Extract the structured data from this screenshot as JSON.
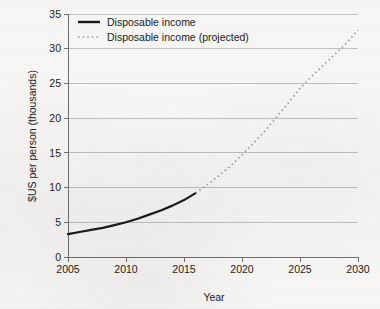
{
  "chart_data": {
    "type": "line",
    "title": "",
    "xlabel": "Year",
    "ylabel": "$US per person (thousands)",
    "xlim": [
      2005,
      2030
    ],
    "ylim": [
      0,
      35
    ],
    "grid": true,
    "legend_position": "top-left",
    "xticks": [
      "2005",
      "2010",
      "2015",
      "2020",
      "2025",
      "2030"
    ],
    "xtick_values": [
      2005,
      2010,
      2015,
      2020,
      2025,
      2030
    ],
    "yticks": [
      "0",
      "5",
      "10",
      "15",
      "20",
      "25",
      "30",
      "35"
    ],
    "ytick_values": [
      0,
      5,
      10,
      15,
      20,
      25,
      30,
      35
    ],
    "series": [
      {
        "name": "Disposable income",
        "style": "solid",
        "color": "#1a1a1a",
        "x": [
          2005,
          2006,
          2007,
          2008,
          2009,
          2010,
          2011,
          2012,
          2013,
          2014,
          2015,
          2016
        ],
        "values": [
          3.3,
          3.6,
          3.9,
          4.2,
          4.6,
          5.0,
          5.5,
          6.1,
          6.7,
          7.4,
          8.2,
          9.2
        ]
      },
      {
        "name": "Disposable income (projected)",
        "style": "dotted",
        "color": "#9a9a9a",
        "x": [
          2016,
          2017,
          2018,
          2019,
          2020,
          2021,
          2022,
          2023,
          2024,
          2025,
          2026,
          2027,
          2028,
          2029,
          2030
        ],
        "values": [
          9.2,
          10.4,
          11.7,
          13.1,
          14.7,
          16.4,
          18.2,
          20.2,
          22.2,
          24.3,
          26.0,
          27.6,
          29.2,
          30.8,
          32.7
        ]
      }
    ]
  },
  "legend": {
    "entries": [
      {
        "label": "Disposable income",
        "style": "solid"
      },
      {
        "label": "Disposable income (projected)",
        "style": "dotted"
      }
    ]
  },
  "axes": {
    "x_title": "Year",
    "y_title": "$US per person (thousands)"
  },
  "colors": {
    "background": "#f7f6f4",
    "actual_line": "#1a1a1a",
    "projected_line": "#9a9a9a",
    "gridline": "#b9b9b9",
    "axis": "#6f6f6f",
    "text": "#1b1b1b"
  }
}
